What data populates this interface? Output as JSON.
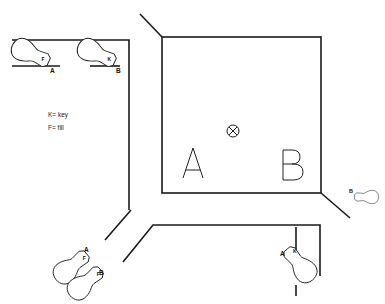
{
  "diagram": {
    "type": "lighting-plan",
    "legend": {
      "key_line": "K= key",
      "fill_line": "F= fill"
    },
    "stage": {
      "label_a": "A",
      "label_b": "B",
      "center_marker": "camera-position-icon"
    },
    "lights": [
      {
        "id": "top-left-fill",
        "position_label": "A",
        "type_label": "F"
      },
      {
        "id": "top-right-key",
        "position_label": "B",
        "type_label": "K"
      },
      {
        "id": "right-light",
        "position_label": "B",
        "type_label": ""
      },
      {
        "id": "bottom-left-fill-a",
        "position_label": "A",
        "type_label": "F"
      },
      {
        "id": "bottom-left-fill-b",
        "position_label": "B",
        "type_label": "F"
      },
      {
        "id": "bottom-right-key",
        "position_label": "A",
        "type_label": "K"
      }
    ]
  }
}
